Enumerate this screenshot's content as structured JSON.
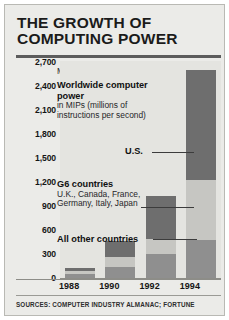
{
  "title": {
    "line1": "THE GROWTH OF",
    "line2": "COMPUTING POWER"
  },
  "axis": {
    "units_label": "Millions",
    "y_ticks": [
      "2,700",
      "2,400",
      "2,100",
      "1,800",
      "1,500",
      "1,200",
      "900",
      "600",
      "300",
      "0"
    ],
    "x_ticks": [
      "1988",
      "1990",
      "1992",
      "1994"
    ]
  },
  "annotations": {
    "worldwide_head": "Worldwide computer",
    "worldwide_head2": "power",
    "worldwide_sub1": "in MIPs (millions of",
    "worldwide_sub2": "instructions per second)",
    "us": "U.S.",
    "g6_head": "G6 countries",
    "g6_sub1": "U.K., Canada, France,",
    "g6_sub2": "Germany, Italy, Japan",
    "other": "All other countries"
  },
  "footer": {
    "source": "SOURCES: COMPUTER INDUSTRY ALMANAC; FORTUNE"
  },
  "colors": {
    "us": "#6e6e6e",
    "g6": "#c6c6c2",
    "other": "#8f8f8f",
    "panel": "#ebebe8",
    "plot": "#e4e4e0"
  },
  "chart_data": {
    "type": "bar",
    "stacked": true,
    "title": "THE GROWTH OF COMPUTING POWER",
    "subtitle": "Worldwide computer power in MIPs (millions of instructions per second)",
    "xlabel": "",
    "ylabel": "Millions",
    "categories": [
      "1988",
      "1990",
      "1992",
      "1994"
    ],
    "ylim": [
      0,
      2700
    ],
    "ytick_step": 300,
    "grid": false,
    "legend": "inline-annotations",
    "series": [
      {
        "name": "All other countries",
        "color": "#8f8f8f",
        "values": [
          55,
          140,
          300,
          480
        ]
      },
      {
        "name": "G6 countries",
        "color": "#c6c6c2",
        "values": [
          35,
          120,
          190,
          750
        ]
      },
      {
        "name": "U.S.",
        "color": "#6e6e6e",
        "values": [
          40,
          200,
          530,
          1370
        ]
      }
    ],
    "totals": [
      130,
      460,
      1020,
      2600
    ],
    "source": "SOURCES: COMPUTER INDUSTRY ALMANAC; FORTUNE"
  }
}
